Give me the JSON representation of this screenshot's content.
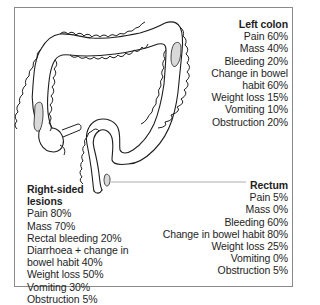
{
  "figure": {
    "colors": {
      "outline": "#1e1e1e",
      "lesion_fill": "#d9d9d9",
      "frame": "#8a8a8a",
      "leader_line": "#9a9a9a"
    }
  },
  "left_colon": {
    "title": "Left colon",
    "items": [
      "Pain 60%",
      "Mass 40%",
      "Bleeding 20%",
      "Change in bowel",
      "habit 60%",
      "Weight loss 15%",
      "Vomiting 10%",
      "Obstruction 20%"
    ]
  },
  "right_sided": {
    "title_line1": "Right-sided",
    "title_line2": "lesions",
    "items": [
      "Pain 80%",
      "Mass 70%",
      "Rectal bleeding 20%",
      "Diarrhoea + change in",
      "bowel habit 40%",
      "Weight loss 50%",
      "Vomiting 30%",
      "Obstruction 5%"
    ]
  },
  "rectum": {
    "title": "Rectum",
    "items": [
      "Pain 5%",
      "Mass 0%",
      "Bleeding 60%",
      "Change in bowel habit 80%",
      "Weight loss 25%",
      "Vomiting 0%",
      "Obstruction 5%"
    ]
  }
}
